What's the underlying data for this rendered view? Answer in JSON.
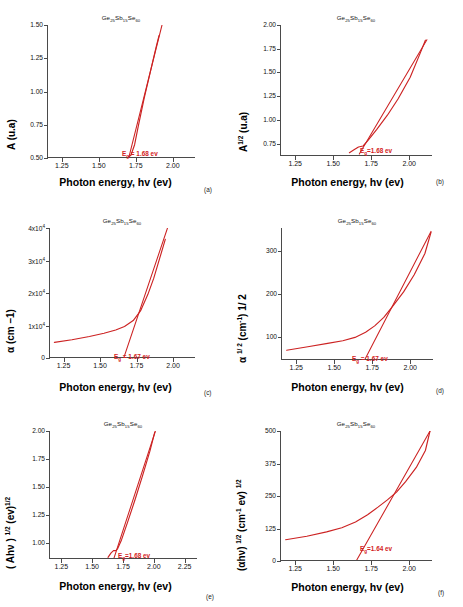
{
  "figure": {
    "material": "Ge25Sb15Se60",
    "material_html": "Ge<sub>25</sub>Sb<sub>15</sub>Se<sub>60</sub>",
    "curve_color": "#cc2222",
    "axis_color": "#4a4a4a",
    "xlabel": "Photon energy, hv (ev)",
    "xlabel_e": "Photon energy, hv  (ev)"
  },
  "chart_data": [
    {
      "type": "line",
      "panel": "(a)",
      "title": "Ge25Sb15Se60",
      "xlabel": "Photon energy, hv (ev)",
      "ylabel": "A (u.a)",
      "xlim": [
        1.15,
        2.15
      ],
      "ylim": [
        0.5,
        1.5
      ],
      "xticks": [
        "1.25",
        "1.50",
        "1.75",
        "2.00"
      ],
      "xtick_values": [
        1.25,
        1.5,
        1.75,
        2.0
      ],
      "yticks": [
        "0.50",
        "0.75",
        "1.00",
        "1.25",
        "1.50"
      ],
      "ytick_values": [
        0.5,
        0.75,
        1.0,
        1.25,
        1.5
      ],
      "annotation": "E_g = 1.68 ev",
      "eg_value": 1.68,
      "grid": false,
      "series": [
        {
          "name": "absorbance",
          "x": [
            1.62,
            1.66,
            1.69,
            1.71,
            1.735,
            1.76,
            1.8,
            1.84,
            1.88,
            1.9
          ],
          "y": [
            0.5,
            0.5,
            0.505,
            0.52,
            0.6,
            0.74,
            0.95,
            1.14,
            1.33,
            1.42
          ]
        },
        {
          "name": "tauc-extrapolation",
          "x": [
            1.695,
            1.92
          ],
          "y": [
            0.5,
            1.5
          ]
        }
      ]
    },
    {
      "type": "line",
      "panel": "(b)",
      "title": "Ge25Sb15Se60",
      "xlabel": "Photon energy, hv (ev)",
      "ylabel": "A 1/2 (u.a)",
      "xlim": [
        1.15,
        2.15
      ],
      "ylim": [
        0.62,
        2.0
      ],
      "xticks": [
        "1.25",
        "1.50",
        "1.75",
        "2.00"
      ],
      "xtick_values": [
        1.25,
        1.5,
        1.75,
        2.0
      ],
      "yticks": [
        "0.75",
        "1.00",
        "1.25",
        "1.50",
        "1.75",
        "2.00"
      ],
      "ytick_values": [
        0.75,
        1.0,
        1.25,
        1.5,
        1.75,
        2.0
      ],
      "annotation": "E_g=1.68 ev",
      "eg_value": 1.68,
      "grid": false,
      "series": [
        {
          "name": "sqrt-absorbance",
          "x": [
            1.6,
            1.63,
            1.66,
            1.69,
            1.72,
            1.78,
            1.85,
            1.92,
            2.0,
            2.06,
            2.1
          ],
          "y": [
            0.655,
            0.685,
            0.715,
            0.725,
            0.78,
            0.9,
            1.05,
            1.22,
            1.45,
            1.68,
            1.84
          ]
        },
        {
          "name": "tauc-extrapolation",
          "x": [
            1.665,
            2.11
          ],
          "y": [
            0.64,
            1.845
          ]
        }
      ]
    },
    {
      "type": "line",
      "panel": "(c)",
      "title": "Ge25Sb15Se60",
      "xlabel": "Photon energy, hv (ev)",
      "ylabel": "a (cm -1)",
      "xlim": [
        1.15,
        2.15
      ],
      "ylim": [
        0,
        40000
      ],
      "xticks": [
        "1.25",
        "1.50",
        "1.75",
        "2.00"
      ],
      "xtick_values": [
        1.25,
        1.5,
        1.75,
        2.0
      ],
      "yticks": [
        "0",
        "1x10^4",
        "2x10^4",
        "3x10^4",
        "4x10^4"
      ],
      "ytick_values": [
        0,
        10000,
        20000,
        30000,
        40000
      ],
      "annotation": "E_g = 1.67 ev",
      "eg_value": 1.67,
      "grid": false,
      "series": [
        {
          "name": "absorption-coefficient",
          "x": [
            1.18,
            1.3,
            1.42,
            1.52,
            1.6,
            1.66,
            1.72,
            1.77,
            1.82,
            1.86,
            1.9,
            1.94
          ],
          "y": [
            4800,
            5600,
            6600,
            7600,
            8600,
            9700,
            11500,
            14500,
            19500,
            24500,
            30500,
            36500
          ]
        },
        {
          "name": "tauc-extrapolation",
          "x": [
            1.655,
            1.955
          ],
          "y": [
            0,
            40000
          ]
        }
      ]
    },
    {
      "type": "line",
      "panel": "(d)",
      "title": "Ge25Sb15Se60",
      "xlabel": "Photon energy, hv (ev)",
      "ylabel": "a 1/2 (cm-1) 1/ 2",
      "xlim": [
        1.15,
        2.15
      ],
      "ylim": [
        45,
        355
      ],
      "xticks": [
        "1.25",
        "1.50",
        "1.75",
        "2.00"
      ],
      "xtick_values": [
        1.25,
        1.5,
        1.75,
        2.0
      ],
      "yticks": [
        "100",
        "200",
        "300"
      ],
      "ytick_values": [
        100,
        200,
        300
      ],
      "annotation": "E_g = 1.67 ev",
      "eg_value": 1.67,
      "grid": false,
      "series": [
        {
          "name": "sqrt-alpha",
          "x": [
            1.18,
            1.32,
            1.45,
            1.55,
            1.63,
            1.7,
            1.76,
            1.82,
            1.88,
            1.95,
            2.02,
            2.09,
            2.13
          ],
          "y": [
            68,
            76,
            84,
            90,
            98,
            110,
            125,
            145,
            172,
            205,
            245,
            295,
            345
          ]
        },
        {
          "name": "tauc-extrapolation",
          "x": [
            1.695,
            2.13
          ],
          "y": [
            46,
            347
          ]
        }
      ]
    },
    {
      "type": "line",
      "panel": "(e)",
      "title": "Ge25Sb15Se60",
      "xlabel": "Photon energy, hv  (ev)",
      "ylabel": "( Ahv ) 1/2 (ev)1/2",
      "xlim": [
        1.15,
        2.35
      ],
      "ylim": [
        0.86,
        2.0
      ],
      "xticks": [
        "1.25",
        "1.50",
        "1.75",
        "2.00",
        "2.25"
      ],
      "xtick_values": [
        1.25,
        1.5,
        1.75,
        2.0,
        2.25
      ],
      "yticks": [
        "1.00",
        "1.25",
        "1.50",
        "1.75",
        "2.00"
      ],
      "ytick_values": [
        1.0,
        1.25,
        1.5,
        1.75,
        2.0
      ],
      "annotation": "E_g=1.68 ev",
      "eg_value": 1.68,
      "grid": false,
      "series": [
        {
          "name": "tauc-direct",
          "x": [
            1.62,
            1.645,
            1.665,
            1.685,
            1.7,
            1.73,
            1.78,
            1.84,
            1.9,
            1.96,
            2.0
          ],
          "y": [
            0.875,
            0.915,
            0.935,
            0.935,
            0.955,
            1.03,
            1.19,
            1.39,
            1.6,
            1.82,
            1.99
          ]
        },
        {
          "name": "tauc-extrapolation",
          "x": [
            1.668,
            2.005
          ],
          "y": [
            0.865,
            2.0
          ]
        }
      ]
    },
    {
      "type": "line",
      "panel": "(f)",
      "title": "Ge25Sb15Se60",
      "xlabel": "Photon energy, hv (ev)",
      "ylabel": "(ahv) 1/2 (cm-1 ev) 1/2",
      "xlim": [
        1.15,
        2.15
      ],
      "ylim": [
        0,
        500
      ],
      "xticks": [
        "1.25",
        "1.50",
        "1.75",
        "2.00"
      ],
      "xtick_values": [
        1.25,
        1.5,
        1.75,
        2.0
      ],
      "yticks": [
        "0",
        "125",
        "250",
        "375",
        "500"
      ],
      "ytick_values": [
        0,
        125,
        250,
        375,
        500
      ],
      "annotation": "E_g=1.64 ev",
      "eg_value": 1.64,
      "grid": false,
      "series": [
        {
          "name": "tauc-indirect",
          "x": [
            1.18,
            1.32,
            1.45,
            1.55,
            1.64,
            1.72,
            1.79,
            1.85,
            1.91,
            1.97,
            2.04,
            2.1,
            2.13
          ],
          "y": [
            82,
            95,
            112,
            128,
            150,
            178,
            208,
            235,
            265,
            305,
            360,
            425,
            500
          ]
        },
        {
          "name": "tauc-extrapolation",
          "x": [
            1.645,
            2.13
          ],
          "y": [
            0,
            500
          ]
        }
      ]
    }
  ],
  "panels": {
    "a": {
      "letter": "(a)",
      "ylabel": "A (u.a)"
    },
    "b": {
      "letter": "(b)",
      "ylabel_main": "A",
      "ylabel_sup": "1/2",
      "ylabel_tail": " (u.a)"
    },
    "c": {
      "letter": "(c)",
      "ylabel_main": "α  (cm ",
      "ylabel_tail": "1)"
    },
    "d": {
      "letter": "(d)",
      "ylabel_main": "α",
      "ylabel_sup": "1/ 2",
      "ylabel_tail": " (cm-1) 1/ 2"
    },
    "e": {
      "letter": "(e)",
      "ylabel": "( Ahν ) 1/2 (ev)1/2"
    },
    "f": {
      "letter": "(f)",
      "ylabel": "(αhν) 1/2 (cm-1 ev) 1/2"
    }
  }
}
